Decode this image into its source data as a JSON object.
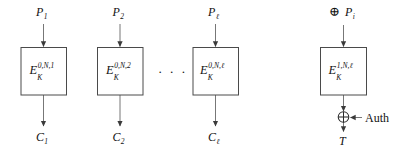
{
  "figure": {
    "type": "block-cipher-mode-diagram",
    "background_color": "#ffffff",
    "line_color": "#6b6b6b",
    "box_border_color": "#4a4a4a",
    "text_color": "#111111",
    "ellipsis": "· · ·"
  },
  "columns": [
    {
      "id": "col-1",
      "input_label": "P",
      "input_sub": "1",
      "block_base": "E",
      "block_sub": "K",
      "block_sup": "0,N,1",
      "output_label": "C",
      "output_sub": "1"
    },
    {
      "id": "col-2",
      "input_label": "P",
      "input_sub": "2",
      "block_base": "E",
      "block_sub": "K",
      "block_sup": "0,N,2",
      "output_label": "C",
      "output_sub": "2"
    },
    {
      "id": "col-3",
      "input_label": "P",
      "input_sub": "ℓ",
      "block_base": "E",
      "block_sub": "K",
      "block_sup": "0,N,ℓ",
      "output_label": "C",
      "output_sub": "ℓ"
    },
    {
      "id": "col-tag",
      "input_xor": "⊕",
      "input_label": "P",
      "input_sub": "i",
      "block_base": "E",
      "block_sub": "K",
      "block_sup": "1,N,ℓ",
      "output_xor": "⊕",
      "side_input_label": "Auth",
      "output_label": "T",
      "output_sub": ""
    }
  ]
}
